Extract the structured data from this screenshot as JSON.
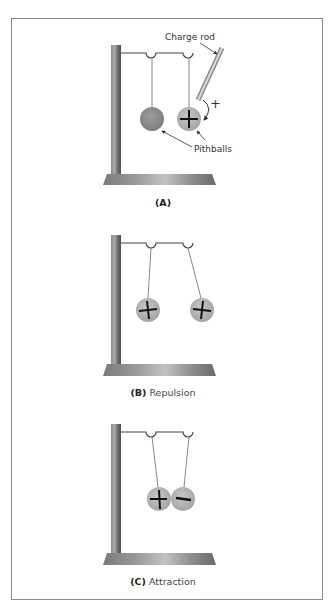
{
  "figure": {
    "panels": [
      {
        "id": "A",
        "caption_letter": "(A)",
        "caption_text": "",
        "labels": {
          "charge_rod": "Charge rod",
          "pithballs": "Pithballs",
          "rod_charge_sign": "+"
        },
        "balls": [
          {
            "sign": ""
          },
          {
            "sign": "+"
          }
        ]
      },
      {
        "id": "B",
        "caption_letter": "(B)",
        "caption_text": "Repulsion",
        "balls": [
          {
            "sign": "+"
          },
          {
            "sign": "+"
          }
        ]
      },
      {
        "id": "C",
        "caption_letter": "(C)",
        "caption_text": "Attraction",
        "balls": [
          {
            "sign": "+"
          },
          {
            "sign": "−"
          }
        ]
      }
    ],
    "colors": {
      "border": "#8a8a8a",
      "pole_dark": "#5a5a5a",
      "pole_light": "#a8a8a8",
      "ball_uncharged": "#8e8e8e",
      "ball_charged": "#b8b8b8",
      "string": "#777777",
      "text": "#333333"
    }
  }
}
